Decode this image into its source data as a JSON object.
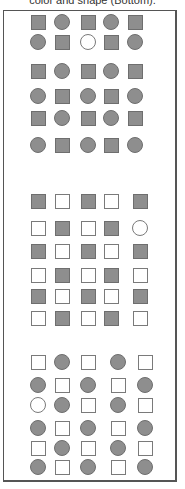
{
  "caption": "color and shape (Bottom).",
  "colors": {
    "filled": "#8e8e8e",
    "outline": "#6e6e6e",
    "empty": "#ffffff"
  },
  "panels": [
    {
      "name": "top-panel",
      "cols": [
        38,
        62,
        88,
        111,
        135
      ],
      "rows_y": [
        22,
        42,
        71,
        96,
        118,
        145
      ],
      "grid": [
        [
          "sq-f",
          "ci-f",
          "sq-f",
          "ci-f",
          "sq-f"
        ],
        [
          "ci-f",
          "sq-f",
          "ci-e",
          "sq-f",
          "ci-f"
        ],
        [
          "sq-f",
          "ci-f",
          "sq-f",
          "ci-f",
          "sq-f"
        ],
        [
          "ci-f",
          "sq-f",
          "ci-f",
          "sq-f",
          "ci-f"
        ],
        [
          "sq-f",
          "ci-f",
          "sq-f",
          "ci-f",
          "sq-f"
        ],
        [
          "ci-f",
          "sq-f",
          "ci-f",
          "sq-f",
          "ci-f"
        ]
      ]
    },
    {
      "name": "middle-panel",
      "cols": [
        38,
        62,
        88,
        111,
        140
      ],
      "rows_y": [
        201,
        228,
        251,
        275,
        296,
        318
      ],
      "grid": [
        [
          "sq-f",
          "sq-e",
          "sq-f",
          "sq-e",
          "sq-f"
        ],
        [
          "sq-e",
          "sq-f",
          "sq-e",
          "sq-f",
          "ci-e"
        ],
        [
          "sq-f",
          "sq-e",
          "sq-f",
          "sq-e",
          "sq-f"
        ],
        [
          "sq-e",
          "sq-f",
          "sq-e",
          "sq-f",
          "sq-e"
        ],
        [
          "sq-f",
          "sq-e",
          "sq-f",
          "sq-e",
          "sq-f"
        ],
        [
          "sq-e",
          "sq-f",
          "sq-e",
          "sq-f",
          "sq-e"
        ]
      ]
    },
    {
      "name": "bottom-panel",
      "cols": [
        38,
        62,
        88,
        118,
        145
      ],
      "rows_y": [
        362,
        385,
        405,
        428,
        448,
        467
      ],
      "grid": [
        [
          "sq-e",
          "ci-f",
          "sq-e",
          "ci-f",
          "sq-e"
        ],
        [
          "ci-f",
          "sq-e",
          "ci-f",
          "sq-e",
          "ci-f"
        ],
        [
          "ci-e",
          "ci-f",
          "sq-e",
          "ci-f",
          "sq-e"
        ],
        [
          "ci-f",
          "sq-e",
          "ci-f",
          "sq-e",
          "ci-f"
        ],
        [
          "sq-e",
          "ci-f",
          "sq-e",
          "ci-f",
          "sq-e"
        ],
        [
          "ci-f",
          "sq-e",
          "ci-f",
          "sq-e",
          "ci-f"
        ]
      ]
    }
  ]
}
